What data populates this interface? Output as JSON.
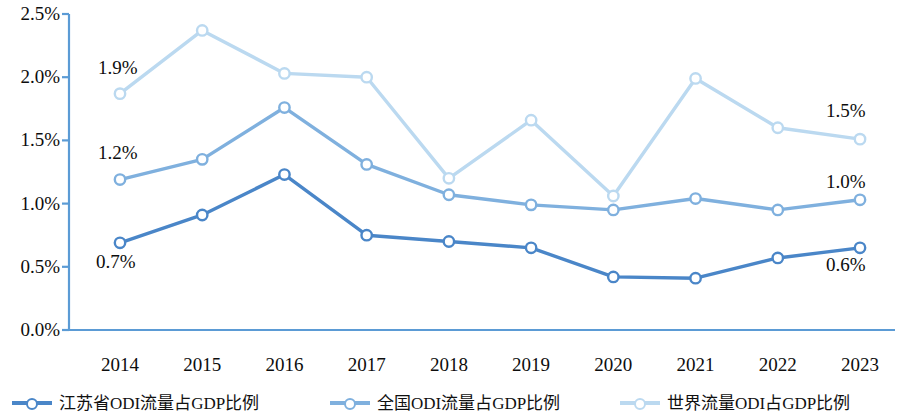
{
  "chart_data": {
    "type": "line",
    "title": "",
    "subtitle": "",
    "xlabel": "",
    "ylabel": "",
    "categories": [
      "2014",
      "2015",
      "2016",
      "2017",
      "2018",
      "2019",
      "2020",
      "2021",
      "2022",
      "2023"
    ],
    "ylim": [
      0.0,
      2.5
    ],
    "ytick_values": [
      2.5,
      2.0,
      1.5,
      1.0,
      0.5,
      0.0
    ],
    "ytick_labels": [
      "2.5%",
      "2.0%",
      "1.5%",
      "1.0%",
      "0.5%",
      "0.0%"
    ],
    "grid": false,
    "legend_position": "bottom",
    "series": [
      {
        "name": "江苏省ODI流量占GDP比例",
        "color": "#4A86C8",
        "values": [
          0.69,
          0.91,
          1.23,
          0.75,
          0.7,
          0.65,
          0.42,
          0.41,
          0.57,
          0.65
        ]
      },
      {
        "name": "全国ODI流量占GDP比例",
        "color": "#7FB0DE",
        "values": [
          1.19,
          1.35,
          1.76,
          1.31,
          1.07,
          0.99,
          0.95,
          1.04,
          0.95,
          1.03
        ]
      },
      {
        "name": "世界流量ODI占GDP比例",
        "color": "#BBD9F0",
        "values": [
          1.87,
          2.37,
          2.03,
          2.0,
          1.2,
          1.66,
          1.06,
          1.99,
          1.6,
          1.51
        ]
      }
    ],
    "annotations": [
      {
        "text": "1.9%",
        "series": "世界流量ODI占GDP比例",
        "category": "2014",
        "x": 98,
        "y": 58
      },
      {
        "text": "1.2%",
        "series": "全国ODI流量占GDP比例",
        "category": "2014",
        "x": 98,
        "y": 143
      },
      {
        "text": "0.7%",
        "series": "江苏省ODI流量占GDP比例",
        "category": "2014",
        "x": 96,
        "y": 252
      },
      {
        "text": "1.5%",
        "series": "世界流量ODI占GDP比例",
        "category": "2023",
        "x": 826,
        "y": 101
      },
      {
        "text": "1.0%",
        "series": "全国ODI流量占GDP比例",
        "category": "2023",
        "x": 826,
        "y": 172
      },
      {
        "text": "0.6%",
        "series": "江苏省ODI流量占GDP比例",
        "category": "2023",
        "x": 826,
        "y": 255
      }
    ]
  },
  "axis": {
    "line_color": "#5B9BD5"
  },
  "legend": {
    "items": [
      {
        "label": "江苏省ODI流量占GDP比例",
        "color": "#4A86C8"
      },
      {
        "label": "全国ODI流量占GDP比例",
        "color": "#7FB0DE"
      },
      {
        "label": "世界流量ODI占GDP比例",
        "color": "#BBD9F0"
      }
    ]
  }
}
